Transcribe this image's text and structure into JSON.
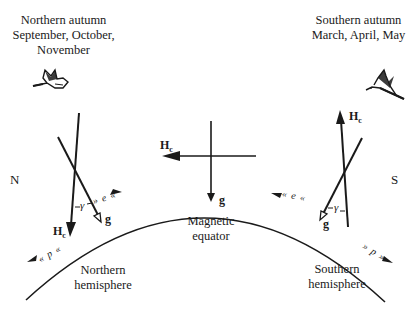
{
  "figure": {
    "north_season": {
      "title": "Northern autumn",
      "months_line1": "September, October,",
      "months_line2": "November"
    },
    "south_season": {
      "title": "Southern autumn",
      "months_line1": "March, April, May"
    },
    "poles": {
      "north": "N",
      "south": "S"
    },
    "center": {
      "label_line1": "Magnetic",
      "label_line2": "equator",
      "field_label": "H",
      "field_sub": "c",
      "gravity_label": "g"
    },
    "north_side": {
      "field_label": "H",
      "field_sub": "c",
      "gravity_label": "g",
      "angle_label": "γ",
      "hemisphere_line1": "Northern",
      "hemisphere_line2": "hemisphere",
      "wave_upper": "» e «",
      "wave_lower": "« p «"
    },
    "south_side": {
      "field_label": "H",
      "field_sub": "c",
      "gravity_label": "g",
      "angle_label": "γ",
      "hemisphere_line1": "Southern",
      "hemisphere_line2": "hemisphere",
      "wave_upper": "« e «",
      "wave_lower": "» p »"
    },
    "colors": {
      "ink": "#1a1a1a",
      "background": "#ffffff"
    }
  }
}
